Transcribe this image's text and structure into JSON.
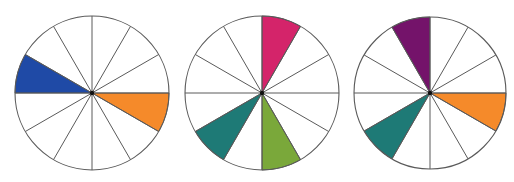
{
  "diagram": {
    "type": "color-wheel-harmonies",
    "segments_per_wheel": 12,
    "wheels": [
      {
        "id": "wheel-complementary",
        "center": [
          92,
          93
        ],
        "radius": 77,
        "filled_segments": [
          {
            "from_deg": 150,
            "to_deg": 180,
            "color": "#1f4aa6",
            "name": "blue"
          },
          {
            "from_deg": 330,
            "to_deg": 360,
            "color": "#f58a2a",
            "name": "orange"
          }
        ]
      },
      {
        "id": "wheel-triadic",
        "center": [
          262,
          93
        ],
        "radius": 77,
        "filled_segments": [
          {
            "from_deg": 60,
            "to_deg": 90,
            "color": "#d4246a",
            "name": "magenta"
          },
          {
            "from_deg": 270,
            "to_deg": 300,
            "color": "#7aa83a",
            "name": "green"
          },
          {
            "from_deg": 210,
            "to_deg": 240,
            "color": "#1e7a76",
            "name": "teal"
          }
        ]
      },
      {
        "id": "wheel-triadic-alt",
        "center": [
          430,
          93
        ],
        "radius": 76,
        "filled_segments": [
          {
            "from_deg": 90,
            "to_deg": 120,
            "color": "#74136a",
            "name": "purple"
          },
          {
            "from_deg": 330,
            "to_deg": 360,
            "color": "#f58a2a",
            "name": "orange"
          },
          {
            "from_deg": 210,
            "to_deg": 240,
            "color": "#1e7a76",
            "name": "teal"
          }
        ]
      }
    ]
  }
}
